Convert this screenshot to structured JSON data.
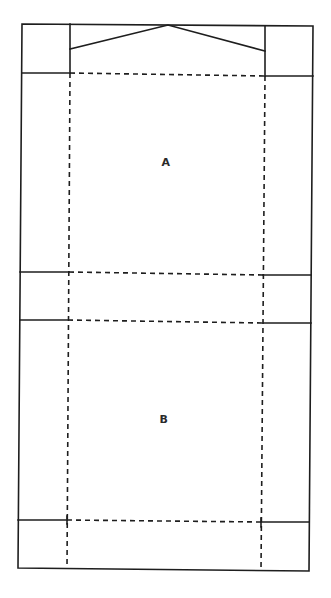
{
  "diagram": {
    "type": "box-net-template",
    "colors": {
      "line": "#1e1e1e",
      "label": "#2a2a2a",
      "background": "#ffffff"
    },
    "panels": [
      {
        "id": "A",
        "label": "A",
        "x": 166,
        "y": 162
      },
      {
        "id": "B",
        "label": "B",
        "x": 164,
        "y": 419
      }
    ],
    "line_styles": {
      "solid": "cut line",
      "dashed": "fold line"
    }
  }
}
